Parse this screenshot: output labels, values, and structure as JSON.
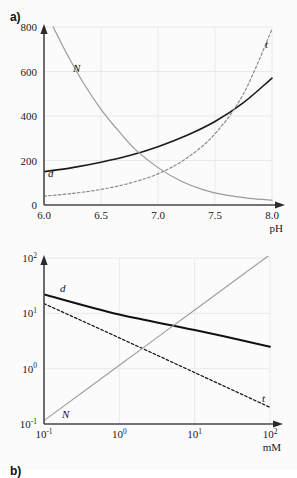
{
  "figure": {
    "background_color": "#fbfbfb",
    "panels": [
      {
        "id": "a",
        "label": "a)"
      },
      {
        "id": "b",
        "label": "b)"
      }
    ]
  },
  "chart_data": [
    {
      "type": "line",
      "panel": "a",
      "title": "",
      "xlabel": "pH",
      "ylabel": "",
      "xscale": "linear",
      "yscale": "linear",
      "xlim": [
        6.0,
        8.0
      ],
      "ylim": [
        0,
        800
      ],
      "grid": true,
      "legend": "inline-curve-labels",
      "xticks": [
        "6.0",
        "6.5",
        "7.0",
        "7.5",
        "8.0"
      ],
      "xtick_values": [
        6.0,
        6.5,
        7.0,
        7.5,
        8.0
      ],
      "yticks": [
        "0",
        "200",
        "400",
        "600",
        "800"
      ],
      "ytick_values": [
        0,
        200,
        400,
        600,
        800
      ],
      "series": [
        {
          "name": "d",
          "label": "d",
          "style": "solid",
          "color": "#1a1a1a",
          "width": 1.6,
          "x": [
            6.0,
            6.25,
            6.5,
            6.75,
            7.0,
            7.25,
            7.5,
            7.75,
            8.0
          ],
          "values": [
            150,
            168,
            192,
            222,
            262,
            312,
            375,
            460,
            570
          ]
        },
        {
          "name": "t",
          "label": "t",
          "style": "dashed",
          "color": "#8c8c8c",
          "width": 1.2,
          "x": [
            6.0,
            6.25,
            6.5,
            6.75,
            7.0,
            7.25,
            7.5,
            7.75,
            8.0
          ],
          "values": [
            40,
            52,
            70,
            98,
            140,
            210,
            320,
            500,
            790
          ]
        },
        {
          "name": "N",
          "label": "N",
          "style": "solid",
          "color": "#9a9a9a",
          "width": 1.2,
          "x": [
            6.08,
            6.2,
            6.35,
            6.5,
            6.65,
            6.8,
            7.0,
            7.2,
            7.4,
            7.6,
            7.8,
            8.0
          ],
          "values": [
            800,
            680,
            545,
            430,
            335,
            250,
            168,
            108,
            68,
            44,
            30,
            22
          ]
        }
      ]
    },
    {
      "type": "line",
      "panel": "b",
      "title": "",
      "xlabel": "mM",
      "ylabel": "",
      "xscale": "log",
      "yscale": "log",
      "xlim": [
        0.1,
        100
      ],
      "ylim": [
        0.1,
        100
      ],
      "grid": true,
      "legend": "inline-curve-labels",
      "xticks": [
        "10-1",
        "100",
        "101",
        "102"
      ],
      "xtick_exponents": [
        "-1",
        "0",
        "1",
        "2"
      ],
      "xtick_values": [
        0.1,
        1,
        10,
        100
      ],
      "yticks": [
        "10-1",
        "100",
        "101",
        "102"
      ],
      "ytick_exponents": [
        "-1",
        "0",
        "1",
        "2"
      ],
      "ytick_values": [
        0.1,
        1,
        10,
        100
      ],
      "series": [
        {
          "name": "d",
          "label": "d",
          "style": "solid",
          "color": "#111111",
          "width": 2.0,
          "x": [
            0.1,
            1,
            10,
            100
          ],
          "values": [
            22,
            9.5,
            5.0,
            2.5
          ]
        },
        {
          "name": "t",
          "label": "t",
          "style": "dashed",
          "color": "#1a1a1a",
          "width": 1.3,
          "x": [
            0.1,
            1,
            10,
            100
          ],
          "values": [
            15,
            3.6,
            0.85,
            0.2
          ]
        },
        {
          "name": "N",
          "label": "N",
          "style": "solid",
          "color": "#a0a0a0",
          "width": 1.2,
          "x": [
            0.1,
            1,
            10,
            100
          ],
          "values": [
            0.115,
            1.15,
            11.5,
            115
          ]
        }
      ]
    }
  ]
}
